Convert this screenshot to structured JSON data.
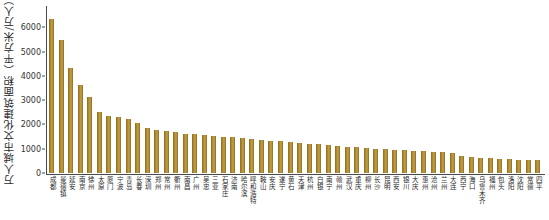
{
  "chart_data": {
    "type": "bar",
    "title": "",
    "subtitle": "",
    "xlabel": "",
    "ylabel": "万人城市文化建筑面积（平方米/万人）",
    "ylim": [
      0,
      6800
    ],
    "yticks": [
      0,
      1000,
      2000,
      3000,
      4000,
      5000,
      6000
    ],
    "ytick_labels": [
      "0",
      "1000",
      "2000",
      "3000",
      "4000",
      "5000",
      "6000"
    ],
    "grid": false,
    "legend": false,
    "legend_position": "none",
    "bar_color": "#a8812b",
    "background_color": "#ffffff",
    "axis_color": "#4a4a4a",
    "categories": [
      "成都",
      "景德镇",
      "延安",
      "南京",
      "徐州",
      "太原",
      "厦门",
      "宁波",
      "青岛",
      "长春",
      "深圳",
      "郑州",
      "常州",
      "衢州",
      "南昌",
      "广州",
      "吴忠",
      "三亚",
      "石家庄",
      "济南",
      "哈尔滨",
      "呼和浩特",
      "鞍山",
      "安庆",
      "遂宁",
      "黄石",
      "天津",
      "杭州",
      "白银",
      "南宁",
      "赣州",
      "武汉",
      "重庆",
      "柳州",
      "长沙",
      "昆明",
      "西安",
      "银川",
      "大庆",
      "惠州",
      "沧州",
      "兰州",
      "大连",
      "西宁",
      "海口",
      "乌鲁木齐",
      "福州",
      "包头",
      "洛阳",
      "沈阳",
      "常德",
      "四平"
    ],
    "values": [
      6350,
      5500,
      4320,
      3620,
      3150,
      2500,
      2360,
      2300,
      2240,
      2060,
      1860,
      1760,
      1720,
      1700,
      1620,
      1610,
      1560,
      1520,
      1500,
      1470,
      1440,
      1400,
      1360,
      1330,
      1300,
      1270,
      1240,
      1210,
      1180,
      1150,
      1120,
      1090,
      1060,
      1030,
      1000,
      980,
      960,
      940,
      920,
      900,
      880,
      860,
      840,
      700,
      660,
      620,
      600,
      580,
      560,
      545,
      535,
      530
    ]
  }
}
